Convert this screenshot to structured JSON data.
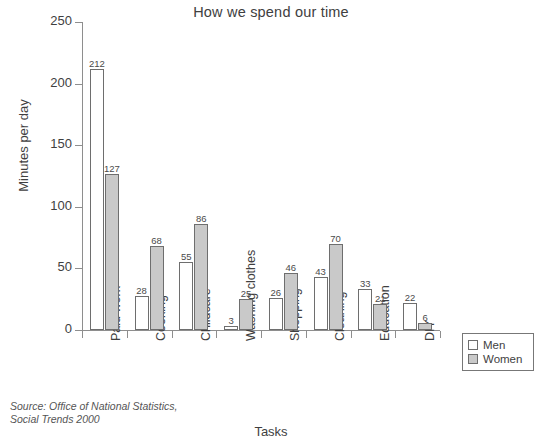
{
  "chart_data": {
    "type": "bar",
    "title": "How we spend our time",
    "xlabel": "Tasks",
    "ylabel": "Minutes per day",
    "categories": [
      "Paid work",
      "Cooking",
      "Childcare",
      "Washing clothes",
      "Shopping",
      "Cleaning",
      "Education",
      "DIY"
    ],
    "series": [
      {
        "name": "Men",
        "values": [
          212,
          28,
          55,
          3,
          26,
          43,
          33,
          22
        ],
        "color": "#ffffff"
      },
      {
        "name": "Women",
        "values": [
          127,
          68,
          86,
          25,
          46,
          70,
          21,
          6
        ],
        "color": "#c9c9c9"
      }
    ],
    "ylim": [
      0,
      250
    ],
    "yticks": [
      0,
      50,
      100,
      150,
      200,
      250
    ],
    "ytick_labels": [
      "0",
      "50",
      "100",
      "150",
      "200",
      "250"
    ],
    "grid": false,
    "legend_position": "bottom-right",
    "data_labels": true
  },
  "legend": {
    "items": [
      {
        "label": "Men",
        "swatch": "white-square-icon"
      },
      {
        "label": "Women",
        "swatch": "gray-square-icon"
      }
    ]
  },
  "source": {
    "line1": "Source: Office of National Statistics,",
    "line2": "Social Trends 2000"
  }
}
